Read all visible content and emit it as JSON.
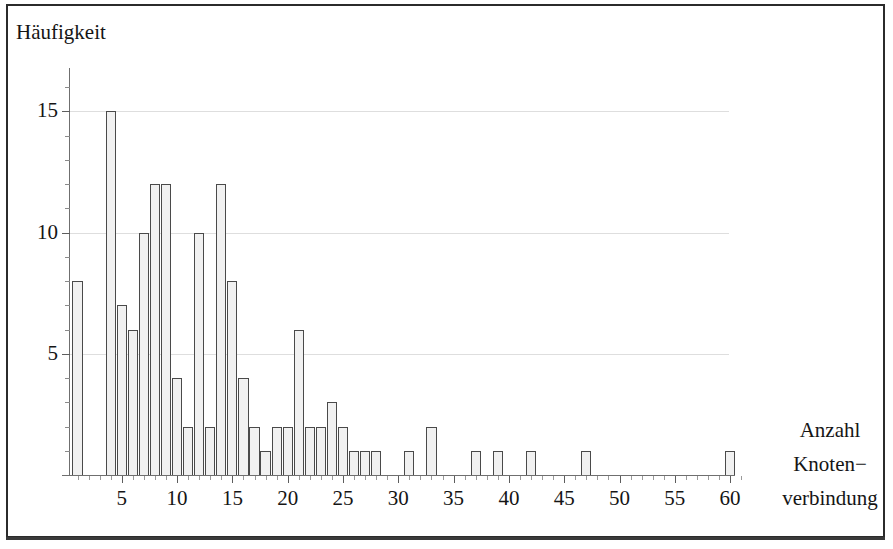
{
  "figure": {
    "y_axis_title": "Häufigkeit",
    "x_axis_title_lines": [
      "Anzahl",
      "Knoten−",
      "verbindung"
    ],
    "frame_color": "#2b2b2b",
    "bar_fill": "#f1f1f1",
    "bar_stroke": "#4a4a4a",
    "grid_color": "#dedede",
    "axis_color": "#6f6f6f"
  },
  "axes": {
    "y_tick_labels": [
      "15",
      "10",
      "5"
    ],
    "y_tick_values": [
      15,
      10,
      5
    ],
    "x_tick_labels": [
      "5",
      "10",
      "15",
      "20",
      "25",
      "30",
      "35",
      "40",
      "45",
      "50",
      "55",
      "60"
    ],
    "x_tick_values": [
      5,
      10,
      15,
      20,
      25,
      30,
      35,
      40,
      45,
      50,
      55,
      60
    ]
  },
  "chart_data": {
    "type": "bar",
    "title": "",
    "subtitle": "",
    "xlabel": "Anzahl Knoten−verbindung",
    "ylabel": "Häufigkeit",
    "xlim": [
      0,
      61
    ],
    "ylim": [
      0,
      16
    ],
    "grid": true,
    "legend": "none",
    "xticks": [
      5,
      10,
      15,
      20,
      25,
      30,
      35,
      40,
      45,
      50,
      55,
      60
    ],
    "yticks": [
      5,
      10,
      15
    ],
    "categories": [
      1,
      4,
      5,
      6,
      7,
      8,
      9,
      10,
      11,
      12,
      13,
      14,
      15,
      16,
      17,
      18,
      19,
      20,
      21,
      22,
      23,
      24,
      25,
      26,
      27,
      28,
      31,
      33,
      37,
      39,
      42,
      47,
      60
    ],
    "values": [
      8,
      15,
      7,
      6,
      10,
      12,
      12,
      4,
      2,
      10,
      2,
      12,
      8,
      4,
      2,
      1,
      2,
      2,
      6,
      2,
      2,
      3,
      2,
      1,
      1,
      1,
      1,
      2,
      1,
      1,
      1,
      1,
      1
    ],
    "bars": [
      {
        "x": 1,
        "y": 8
      },
      {
        "x": 4,
        "y": 15
      },
      {
        "x": 5,
        "y": 7
      },
      {
        "x": 6,
        "y": 6
      },
      {
        "x": 7,
        "y": 10
      },
      {
        "x": 8,
        "y": 12
      },
      {
        "x": 9,
        "y": 12
      },
      {
        "x": 10,
        "y": 4
      },
      {
        "x": 11,
        "y": 2
      },
      {
        "x": 12,
        "y": 10
      },
      {
        "x": 13,
        "y": 2
      },
      {
        "x": 14,
        "y": 12
      },
      {
        "x": 15,
        "y": 8
      },
      {
        "x": 16,
        "y": 4
      },
      {
        "x": 17,
        "y": 2
      },
      {
        "x": 18,
        "y": 1
      },
      {
        "x": 19,
        "y": 2
      },
      {
        "x": 20,
        "y": 2
      },
      {
        "x": 21,
        "y": 6
      },
      {
        "x": 22,
        "y": 2
      },
      {
        "x": 23,
        "y": 2
      },
      {
        "x": 24,
        "y": 3
      },
      {
        "x": 25,
        "y": 2
      },
      {
        "x": 26,
        "y": 1
      },
      {
        "x": 27,
        "y": 1
      },
      {
        "x": 28,
        "y": 1
      },
      {
        "x": 31,
        "y": 1
      },
      {
        "x": 33,
        "y": 2
      },
      {
        "x": 37,
        "y": 1
      },
      {
        "x": 39,
        "y": 1
      },
      {
        "x": 42,
        "y": 1
      },
      {
        "x": 47,
        "y": 1
      },
      {
        "x": 60,
        "y": 1
      }
    ]
  },
  "geometry": {
    "x0_px": 66.5,
    "px_per_unit_x": 11.06,
    "baseline_px": 475,
    "px_per_unit_y": 24.25,
    "bar_width_px": 10.2,
    "y_minor_step": 1,
    "x_minor_step": 1
  }
}
